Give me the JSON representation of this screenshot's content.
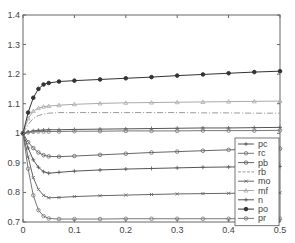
{
  "chart_data": {
    "type": "line",
    "title": "",
    "xlabel": "",
    "ylabel": "",
    "xlim": [
      0,
      0.5
    ],
    "ylim": [
      0.7,
      1.4
    ],
    "xticks": [
      "0",
      "0.1",
      "0.2",
      "0.3",
      "0.4",
      "0.5"
    ],
    "yticks": [
      "0.7",
      "0.8",
      "0.9",
      "1",
      "1.1",
      "1.2",
      "1.3",
      "1.4"
    ],
    "grid": false,
    "legend_position": "lower right",
    "x": [
      0,
      0.01,
      0.02,
      0.03,
      0.04,
      0.05,
      0.07,
      0.1,
      0.15,
      0.2,
      0.25,
      0.3,
      0.35,
      0.4,
      0.45,
      0.5
    ],
    "series": [
      {
        "name": "pc",
        "marker": "+",
        "color": "#555555",
        "values": [
          1.0,
          0.95,
          0.91,
          0.885,
          0.87,
          0.865,
          0.868,
          0.872,
          0.876,
          0.879,
          0.881,
          0.883,
          0.885,
          0.886,
          0.887,
          0.888
        ]
      },
      {
        "name": "rc",
        "marker": "o",
        "color": "#777777",
        "values": [
          1.0,
          0.88,
          0.79,
          0.74,
          0.72,
          0.712,
          0.71,
          0.71,
          0.71,
          0.711,
          0.711,
          0.711,
          0.711,
          0.711,
          0.711,
          0.711
        ]
      },
      {
        "name": "pb",
        "marker": "o",
        "color": "#666666",
        "values": [
          1.0,
          0.97,
          0.95,
          0.935,
          0.926,
          0.922,
          0.921,
          0.923,
          0.927,
          0.931,
          0.935,
          0.938,
          0.941,
          0.944,
          0.946,
          0.948
        ]
      },
      {
        "name": "rb",
        "marker": "none",
        "dash": "dashdot",
        "color": "#999999",
        "values": [
          1.0,
          1.03,
          1.05,
          1.06,
          1.065,
          1.068,
          1.07,
          1.07,
          1.07,
          1.07,
          1.07,
          1.07,
          1.069,
          1.069,
          1.068,
          1.068
        ]
      },
      {
        "name": "mo",
        "marker": "x",
        "color": "#666666",
        "values": [
          1.0,
          0.92,
          0.85,
          0.81,
          0.79,
          0.782,
          0.783,
          0.786,
          0.789,
          0.791,
          0.793,
          0.795,
          0.796,
          0.797,
          0.798,
          0.799
        ]
      },
      {
        "name": "mf",
        "marker": "^",
        "color": "#aaaaaa",
        "values": [
          1.0,
          1.05,
          1.075,
          1.085,
          1.09,
          1.092,
          1.095,
          1.098,
          1.101,
          1.103,
          1.104,
          1.105,
          1.106,
          1.107,
          1.108,
          1.109
        ]
      },
      {
        "name": "n",
        "marker": "+",
        "color": "#555555",
        "values": [
          1.0,
          1.005,
          1.008,
          1.01,
          1.011,
          1.012,
          1.012,
          1.013,
          1.014,
          1.015,
          1.016,
          1.017,
          1.018,
          1.018,
          1.019,
          1.02
        ]
      },
      {
        "name": "po",
        "marker": "*",
        "color": "#333333",
        "values": [
          1.0,
          1.07,
          1.12,
          1.15,
          1.165,
          1.17,
          1.175,
          1.178,
          1.182,
          1.186,
          1.19,
          1.195,
          1.199,
          1.203,
          1.207,
          1.21
        ]
      },
      {
        "name": "pr",
        "marker": "o",
        "color": "#777777",
        "values": [
          1.0,
          1.003,
          1.005,
          1.006,
          1.006,
          1.006,
          1.006,
          1.007,
          1.007,
          1.008,
          1.008,
          1.008,
          1.009,
          1.009,
          1.009,
          1.01
        ]
      }
    ]
  },
  "legend": {
    "items": [
      "pc",
      "rc",
      "pb",
      "rb",
      "mo",
      "mf",
      "n",
      "po",
      "pr"
    ]
  }
}
